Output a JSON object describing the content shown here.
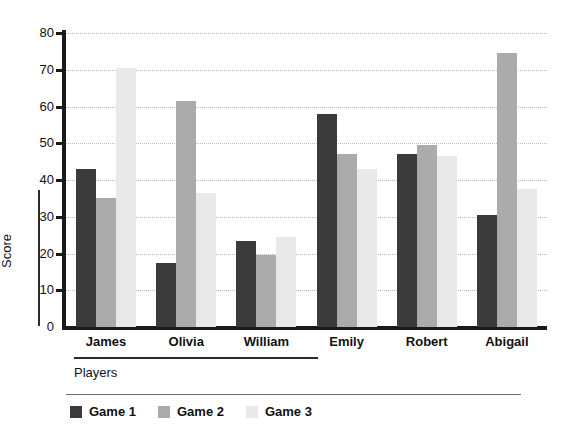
{
  "chart_data": {
    "type": "bar",
    "title": "",
    "xlabel": "Players",
    "ylabel": "Score",
    "categories": [
      "James",
      "Olivia",
      "William",
      "Emily",
      "Robert",
      "Abigail"
    ],
    "series": [
      {
        "name": "Game 1",
        "color": "#3b3b3b",
        "values": [
          43,
          17.5,
          23.5,
          58,
          47,
          30.5
        ]
      },
      {
        "name": "Game 2",
        "color": "#ababab",
        "values": [
          35,
          61.5,
          19.5,
          47,
          49.5,
          74.5
        ]
      },
      {
        "name": "Game 3",
        "color": "#e9e9e9",
        "values": [
          70.5,
          36.5,
          24.5,
          43,
          46.5,
          37.5
        ]
      }
    ],
    "ylim": [
      0,
      80
    ],
    "ytick_values": [
      0,
      10,
      20,
      30,
      40,
      50,
      60,
      70,
      80
    ],
    "ytick_labels": [
      "0",
      "10",
      "20",
      "30",
      "40",
      "50",
      "60",
      "70",
      "80"
    ],
    "grid": true,
    "grid_style": "dotted",
    "legend_position": "bottom-left",
    "axis_color": "#1a1a1a",
    "background": "#ffffff"
  }
}
